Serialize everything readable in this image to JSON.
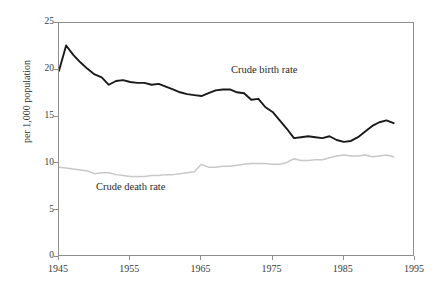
{
  "chart_data": {
    "type": "line",
    "title": "",
    "subtitle": "",
    "xlabel": "",
    "ylabel": "per 1,000 population",
    "xlim": [
      1945,
      1995
    ],
    "ylim": [
      0,
      25
    ],
    "grid": false,
    "legend_position": "inline-annotations",
    "x_ticks": [
      1945,
      1955,
      1965,
      1975,
      1985,
      1995
    ],
    "x_tick_labels": [
      "1945",
      "1955",
      "1965",
      "1975",
      "1985",
      "1995"
    ],
    "y_ticks": [
      0,
      5,
      10,
      15,
      20,
      25
    ],
    "y_tick_labels": [
      "0",
      "5",
      "10",
      "15",
      "20",
      "25"
    ],
    "series": [
      {
        "name": "Crude birth rate",
        "color": "#1a1a1a",
        "line_width": 1.9,
        "annotation": "Crude birth rate",
        "x": [
          1945,
          1946,
          1947,
          1948,
          1949,
          1950,
          1951,
          1952,
          1953,
          1954,
          1955,
          1956,
          1957,
          1958,
          1959,
          1960,
          1961,
          1962,
          1963,
          1964,
          1965,
          1966,
          1967,
          1968,
          1969,
          1970,
          1971,
          1972,
          1973,
          1974,
          1975,
          1976,
          1977,
          1978,
          1979,
          1980,
          1981,
          1982,
          1983,
          1984,
          1985,
          1986,
          1987,
          1988,
          1989,
          1990,
          1991,
          1992
        ],
        "values": [
          19.9,
          22.6,
          21.6,
          20.8,
          20.1,
          19.5,
          19.2,
          18.4,
          18.8,
          18.9,
          18.7,
          18.6,
          18.6,
          18.4,
          18.5,
          18.2,
          17.9,
          17.6,
          17.4,
          17.3,
          17.2,
          17.5,
          17.8,
          17.9,
          17.9,
          17.6,
          17.5,
          16.8,
          16.9,
          16.0,
          15.5,
          14.6,
          13.7,
          12.7,
          12.8,
          12.9,
          12.8,
          12.7,
          12.9,
          12.5,
          12.3,
          12.4,
          12.8,
          13.4,
          14.0,
          14.4,
          14.6,
          14.3
        ]
      },
      {
        "name": "Crude death rate",
        "color": "#c8c8c8",
        "line_width": 1.5,
        "annotation": "Crude death rate",
        "x": [
          1945,
          1946,
          1947,
          1948,
          1949,
          1950,
          1951,
          1952,
          1953,
          1954,
          1955,
          1956,
          1957,
          1958,
          1959,
          1960,
          1961,
          1962,
          1963,
          1964,
          1965,
          1966,
          1967,
          1968,
          1969,
          1970,
          1971,
          1972,
          1973,
          1974,
          1975,
          1976,
          1977,
          1978,
          1979,
          1980,
          1981,
          1982,
          1983,
          1984,
          1985,
          1986,
          1987,
          1988,
          1989,
          1990,
          1991,
          1992
        ],
        "values": [
          9.6,
          9.5,
          9.4,
          9.3,
          9.2,
          8.9,
          9.0,
          9.0,
          8.8,
          8.7,
          8.6,
          8.6,
          8.6,
          8.7,
          8.7,
          8.8,
          8.8,
          8.9,
          9.0,
          9.1,
          9.9,
          9.6,
          9.6,
          9.7,
          9.7,
          9.8,
          9.9,
          10.0,
          10.0,
          10.0,
          9.9,
          9.9,
          10.1,
          10.5,
          10.3,
          10.3,
          10.4,
          10.4,
          10.6,
          10.8,
          10.9,
          10.8,
          10.8,
          10.9,
          10.7,
          10.8,
          10.9,
          10.7
        ]
      }
    ]
  },
  "axes": {
    "y_axis_title": "per 1,000 population",
    "y_tick_labels": [
      "25",
      "20",
      "15",
      "10",
      "5",
      "0"
    ],
    "x_tick_labels": [
      "1945",
      "1955",
      "1965",
      "1975",
      "1985",
      "1995"
    ]
  },
  "annotations": {
    "birth_rate_label": "Crude birth rate",
    "death_rate_label": "Crude death rate"
  },
  "colors": {
    "birth_rate_line": "#1a1a1a",
    "death_rate_line": "#c8c8c8",
    "axis": "#8e8e8e",
    "text": "#2b2b2b",
    "background": "#ffffff"
  }
}
